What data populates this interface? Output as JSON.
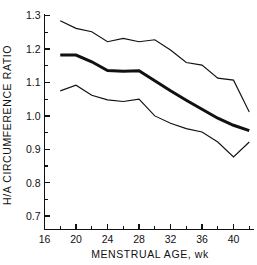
{
  "chart_data": {
    "type": "line",
    "title": "",
    "xlabel": "MENSTRUAL AGE, wk",
    "ylabel": "H/A CIRCUMFERENCE RATIO",
    "xlim": [
      16,
      42.6
    ],
    "ylim": [
      0.66,
      1.305
    ],
    "grid": false,
    "legend_position": "none",
    "xticks_major": [
      16,
      20,
      24,
      28,
      32,
      36,
      40
    ],
    "xtick_labels": [
      "16",
      "20",
      "24",
      "28",
      "32",
      "36",
      "40"
    ],
    "xticks_minor": [
      18,
      22,
      26,
      30,
      34,
      38,
      42
    ],
    "yticks_major": [
      0.7,
      0.8,
      0.9,
      1.0,
      1.1,
      1.2,
      1.3
    ],
    "ytick_labels": [
      "0.7",
      "0.8",
      "0.9",
      "1.0",
      "1.1",
      "1.2",
      "1.3"
    ],
    "yticks_minor": [
      0.75,
      0.85,
      0.95,
      1.05,
      1.15,
      1.25
    ],
    "x": [
      18,
      20,
      22,
      24,
      26,
      28,
      30,
      32,
      34,
      36,
      38,
      40,
      42
    ],
    "series": [
      {
        "name": "upper-percentile",
        "style": "thin",
        "values": [
          1.285,
          1.262,
          1.252,
          1.222,
          1.232,
          1.222,
          1.228,
          1.197,
          1.16,
          1.152,
          1.113,
          1.107,
          1.012
        ]
      },
      {
        "name": "mean",
        "style": "bold",
        "values": [
          1.182,
          1.182,
          1.162,
          1.136,
          1.134,
          1.135,
          1.105,
          1.075,
          1.047,
          1.02,
          0.993,
          0.972,
          0.956
        ]
      },
      {
        "name": "lower-percentile",
        "style": "thin",
        "values": [
          1.075,
          1.092,
          1.062,
          1.048,
          1.043,
          1.05,
          1.0,
          0.978,
          0.962,
          0.952,
          0.922,
          0.877,
          0.922
        ]
      }
    ]
  },
  "axes": {
    "y_title": "H/A CIRCUMFERENCE RATIO",
    "x_title": "MENSTRUAL AGE, wk"
  }
}
